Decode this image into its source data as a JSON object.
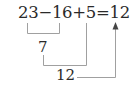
{
  "equation": {
    "expression": "23−16+5=12",
    "terms": [
      "23",
      "16",
      "5",
      "12"
    ],
    "operators": [
      "−",
      "+",
      "="
    ]
  },
  "steps": [
    {
      "label": "7",
      "description": "23 − 16 = 7"
    },
    {
      "label": "12",
      "description": "7 + 5 = 12"
    }
  ],
  "colors": {
    "text": "#2a2a2a",
    "lines": "#9a9a9a"
  }
}
